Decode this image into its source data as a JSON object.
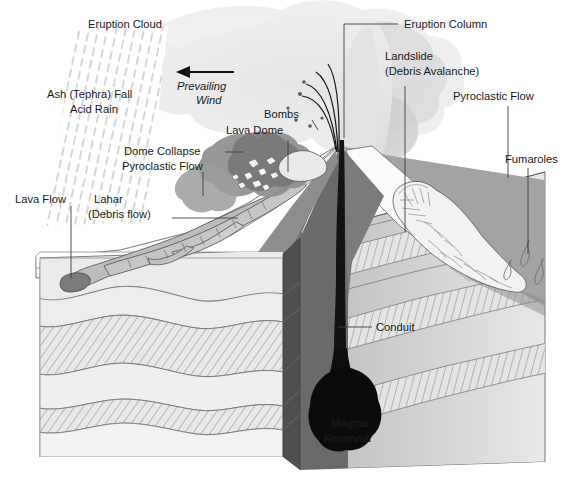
{
  "figure": {
    "width": 575,
    "height": 488,
    "background": "#ffffff"
  },
  "labels": {
    "eruption_cloud": "Eruption Cloud",
    "ash_fall_line1": "Ash (Tephra) Fall",
    "ash_fall_line2": "Acid Rain",
    "prevailing_wind_line1": "Prevailing",
    "prevailing_wind_line2": "Wind",
    "eruption_column": "Eruption Column",
    "landslide_line1": "Landslide",
    "landslide_line2": "(Debris Avalanche)",
    "pyroclastic_flow_right": "Pyroclastic Flow",
    "fumaroles": "Fumaroles",
    "bombs": "Bombs",
    "lava_dome": "Lava Dome",
    "dome_collapse": "Dome Collapse",
    "pyroclastic_flow_left": "Pyroclastic Flow",
    "lava_flow": "Lava Flow",
    "lahar_line1": "Lahar",
    "lahar_line2": "(Debris flow)",
    "conduit": "Conduit",
    "magma_reservoir_line1": "Magma",
    "magma_reservoir_line2": "Reservoir"
  },
  "colors": {
    "background": "#ffffff",
    "text": "#1a1a1a",
    "leader_line": "#3c3c3c",
    "outline": "#5d5d5d",
    "eruption_cloud_light": "#ededed",
    "eruption_cloud_mid": "#e0e0e0",
    "eruption_column": "#e6e6e6",
    "ash_streak": "#b9b9b9",
    "pyroclastic_cloud_dark": "#8f8f8f",
    "pyroclastic_cloud_darker": "#7a7a7a",
    "volcano_flank_dark": "#6e6e6e",
    "volcano_flank_mid": "#9a9a9a",
    "volcano_flank_light": "#f4f4f4",
    "strata_plain": "#ebebeb",
    "strata_hatched": "#e3e3e3",
    "strata_hatch_line": "#8c8c8c",
    "block_side_dark": "#575757",
    "block_right_face": "#cfcfcf",
    "lava_flow_fill": "#bdbdbd",
    "lava_flow_tip": "#7c7c7c",
    "lahar_fill": "#c8c8c8",
    "magma_black": "#0d0d0d",
    "conduit_black": "#1a1a1a"
  },
  "elements": {
    "wind_arrow_direction": "left",
    "bomb_count": 6,
    "ballistic_arc_count": 4,
    "strata_layers": [
      {
        "name": "top-soil",
        "pattern": "plain"
      },
      {
        "name": "layer-2",
        "pattern": "hatched"
      },
      {
        "name": "layer-3",
        "pattern": "plain"
      },
      {
        "name": "layer-4",
        "pattern": "hatched"
      },
      {
        "name": "layer-5",
        "pattern": "plain"
      }
    ],
    "fumarole_count": 3
  }
}
